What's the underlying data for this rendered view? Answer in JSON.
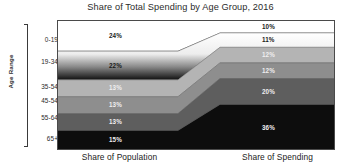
{
  "chart_data": {
    "type": "area",
    "title": "Share of Total Spending by Age Group, 2016",
    "xlabel": "",
    "ylabel": "Age Range",
    "categories": [
      "Share of Population",
      "Share of Spending"
    ],
    "grid": false,
    "legend_position": "none",
    "ylim": [
      0,
      100
    ],
    "axis_tick_labels": [
      "0-19",
      "19-34",
      "35-54",
      "45-54",
      "55-64",
      "65+"
    ],
    "series": [
      {
        "name": "0-19",
        "values": [
          24,
          10
        ],
        "color": "#ffffff",
        "label_color": "#1a1a1a"
      },
      {
        "name": "19-34",
        "values": [
          22,
          11
        ],
        "color": "#d8d8d8",
        "label_color": "#1a1a1a"
      },
      {
        "name": "35-54",
        "values": [
          13,
          12
        ],
        "color": "#b4b4b4",
        "label_color": "#e8e8e8"
      },
      {
        "name": "45-54",
        "values": [
          13,
          12
        ],
        "color": "#8e8e8e",
        "label_color": "#e8e8e8"
      },
      {
        "name": "55-64",
        "values": [
          13,
          20
        ],
        "color": "#5e5e5e",
        "label_color": "#e8e8e8"
      },
      {
        "name": "65+",
        "values": [
          15,
          36
        ],
        "color": "#0d0d0d",
        "label_color": "#e8e8e8"
      }
    ],
    "left_labels": [
      "24%",
      "22%",
      "13%",
      "13%",
      "13%",
      "15%"
    ],
    "right_labels": [
      "10%",
      "11%",
      "12%",
      "12%",
      "20%",
      "36%"
    ]
  },
  "axis": {
    "y_title": "Age Range",
    "ticks": [
      "0-19",
      "19-34",
      "35-54",
      "45-54",
      "55-64",
      "65+"
    ]
  },
  "x_axis": {
    "left_label": "Share of Population",
    "right_label": "Share of Spending"
  }
}
